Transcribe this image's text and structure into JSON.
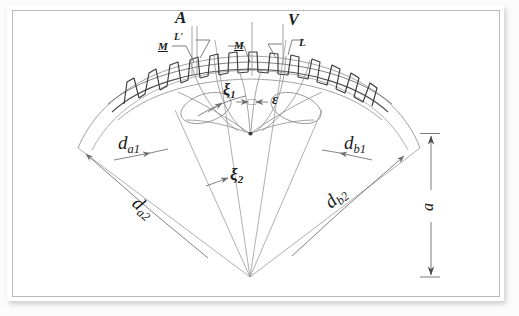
{
  "document": {
    "kind": "scanned-engineering-sketch",
    "subject": "gear mesh geometry diagram",
    "page_background": "#ffffff",
    "ink_color": "#1b1b1b",
    "thin_line_color": "#8a8a8a",
    "frame_color": "#b9b9b9"
  },
  "labels": {
    "a_top": "A",
    "l_prime": "L'",
    "m_left": "M",
    "m_right": "M",
    "l_right": "L",
    "v_right": "V",
    "xi1": "ξ",
    "xi1_sub": "1",
    "epsilon": "ε",
    "xi2": "ξ",
    "xi2_sub": "2",
    "da1": "d",
    "da1_sub": "a1",
    "da2": "d",
    "da2_sub": "a2",
    "db1": "d",
    "db1_sub": "b1",
    "db2": "d",
    "db2_sub": "b2",
    "center_distance": "a"
  }
}
